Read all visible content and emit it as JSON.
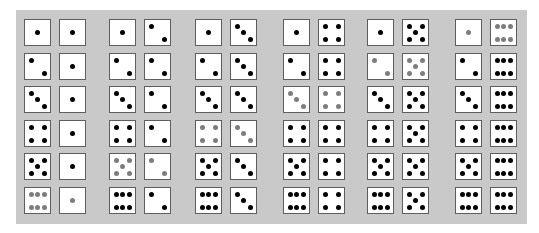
{
  "figure": {
    "highlight_rule": "pairs summing to 7 drawn with gray pips",
    "colors": {
      "panel_background": "#c9c9c9",
      "die_face": "#ffffff",
      "die_border": "#5e5e5e",
      "pip": "#000000",
      "highlighted_pip": "#7d7d7d"
    },
    "groups": [
      {
        "second_die": 1,
        "pairs": [
          [
            1,
            1
          ],
          [
            2,
            1
          ],
          [
            3,
            1
          ],
          [
            4,
            1
          ],
          [
            5,
            1
          ],
          [
            6,
            1
          ]
        ]
      },
      {
        "second_die": 2,
        "pairs": [
          [
            1,
            2
          ],
          [
            2,
            2
          ],
          [
            3,
            2
          ],
          [
            4,
            2
          ],
          [
            5,
            2
          ],
          [
            6,
            2
          ]
        ]
      },
      {
        "second_die": 3,
        "pairs": [
          [
            1,
            3
          ],
          [
            2,
            3
          ],
          [
            3,
            3
          ],
          [
            4,
            3
          ],
          [
            5,
            3
          ],
          [
            6,
            3
          ]
        ]
      },
      {
        "second_die": 4,
        "pairs": [
          [
            1,
            4
          ],
          [
            2,
            4
          ],
          [
            3,
            4
          ],
          [
            4,
            4
          ],
          [
            5,
            4
          ],
          [
            6,
            4
          ]
        ]
      },
      {
        "second_die": 5,
        "pairs": [
          [
            1,
            5
          ],
          [
            2,
            5
          ],
          [
            3,
            5
          ],
          [
            4,
            5
          ],
          [
            5,
            5
          ],
          [
            6,
            5
          ]
        ]
      },
      {
        "second_die": 6,
        "pairs": [
          [
            1,
            6
          ],
          [
            2,
            6
          ],
          [
            3,
            6
          ],
          [
            4,
            6
          ],
          [
            5,
            6
          ],
          [
            6,
            6
          ]
        ]
      }
    ],
    "highlighted_pairs": [
      [
        6,
        1
      ],
      [
        5,
        2
      ],
      [
        4,
        3
      ],
      [
        3,
        4
      ],
      [
        2,
        5
      ],
      [
        1,
        6
      ]
    ]
  }
}
